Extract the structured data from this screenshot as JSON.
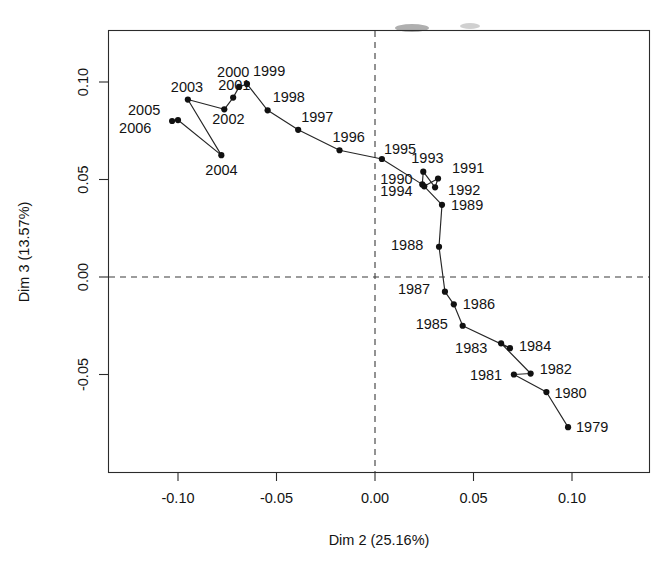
{
  "chart_data": {
    "type": "scatter",
    "title": "",
    "subtitle": "",
    "xlabel": "Dim 2 (25.16%)",
    "ylabel": "Dim 3 (13.57%)",
    "xlim": [
      -0.1245,
      0.1145
    ],
    "ylim": [
      -0.0955,
      0.1255
    ],
    "xticks": [
      "-0.10",
      "-0.05",
      "0.00",
      "0.05",
      "0.10"
    ],
    "xtick_values": [
      -0.1,
      -0.05,
      0.0,
      0.05,
      0.1
    ],
    "yticks": [
      "-0.05",
      "0.00",
      "0.05",
      "0.10"
    ],
    "ytick_values": [
      -0.05,
      0.0,
      0.05,
      0.1
    ],
    "grid": false,
    "legend": "none",
    "reference_lines": [
      {
        "orientation": "vertical",
        "value": 0.0,
        "style": "dashed"
      },
      {
        "orientation": "horizontal",
        "value": 0.0,
        "style": "dashed"
      }
    ],
    "connected": true,
    "connection_order": "1979 to 2006 chronological trajectory",
    "point_labels": [
      "1979",
      "1980",
      "1981",
      "1982",
      "1983",
      "1984",
      "1985",
      "1986",
      "1987",
      "1988",
      "1989",
      "1990",
      "1991",
      "1992",
      "1993",
      "1994",
      "1995",
      "1996",
      "1997",
      "1998",
      "1999",
      "2000",
      "2001",
      "2002",
      "2003",
      "2004",
      "2005",
      "2006"
    ],
    "x": [
      0.098,
      0.087,
      0.0705,
      0.079,
      0.064,
      0.0685,
      0.0445,
      0.04,
      0.0355,
      0.0325,
      0.034,
      0.025,
      0.032,
      0.0305,
      0.0245,
      0.024,
      0.0035,
      -0.018,
      -0.039,
      -0.0545,
      -0.065,
      -0.069,
      -0.072,
      -0.0765,
      -0.095,
      -0.078,
      -0.1,
      -0.103
    ],
    "y": [
      -0.077,
      -0.059,
      -0.05,
      -0.0495,
      -0.034,
      -0.0365,
      -0.025,
      -0.014,
      -0.0075,
      0.0155,
      0.037,
      0.0465,
      0.0505,
      0.046,
      0.054,
      0.0475,
      0.0605,
      0.065,
      0.0755,
      0.0855,
      0.099,
      0.0975,
      0.092,
      0.086,
      0.091,
      0.0625,
      0.0805,
      0.08
    ],
    "points": [
      {
        "label": "1979",
        "x": 0.098,
        "y": -0.077
      },
      {
        "label": "1980",
        "x": 0.087,
        "y": -0.059
      },
      {
        "label": "1981",
        "x": 0.0705,
        "y": -0.05
      },
      {
        "label": "1982",
        "x": 0.079,
        "y": -0.0495
      },
      {
        "label": "1983",
        "x": 0.064,
        "y": -0.034
      },
      {
        "label": "1984",
        "x": 0.0685,
        "y": -0.0365
      },
      {
        "label": "1985",
        "x": 0.0445,
        "y": -0.025
      },
      {
        "label": "1986",
        "x": 0.04,
        "y": -0.014
      },
      {
        "label": "1987",
        "x": 0.0355,
        "y": -0.0075
      },
      {
        "label": "1988",
        "x": 0.0325,
        "y": 0.0155
      },
      {
        "label": "1989",
        "x": 0.034,
        "y": 0.037
      },
      {
        "label": "1990",
        "x": 0.025,
        "y": 0.0465
      },
      {
        "label": "1991",
        "x": 0.032,
        "y": 0.0505
      },
      {
        "label": "1992",
        "x": 0.0305,
        "y": 0.046
      },
      {
        "label": "1993",
        "x": 0.0245,
        "y": 0.054
      },
      {
        "label": "1994",
        "x": 0.024,
        "y": 0.0475
      },
      {
        "label": "1995",
        "x": 0.0035,
        "y": 0.0605
      },
      {
        "label": "1996",
        "x": -0.018,
        "y": 0.065
      },
      {
        "label": "1997",
        "x": -0.039,
        "y": 0.0755
      },
      {
        "label": "1998",
        "x": -0.0545,
        "y": 0.0855
      },
      {
        "label": "1999",
        "x": -0.065,
        "y": 0.099
      },
      {
        "label": "2000",
        "x": -0.069,
        "y": 0.0975
      },
      {
        "label": "2001",
        "x": -0.072,
        "y": 0.092
      },
      {
        "label": "2002",
        "x": -0.0765,
        "y": 0.086
      },
      {
        "label": "2003",
        "x": -0.095,
        "y": 0.091
      },
      {
        "label": "2004",
        "x": -0.078,
        "y": 0.0625
      },
      {
        "label": "2005",
        "x": -0.1,
        "y": 0.0805
      },
      {
        "label": "2006",
        "x": -0.103,
        "y": 0.08
      }
    ],
    "label_offsets": [
      {
        "label": "1979",
        "dx": 8,
        "dy": 5
      },
      {
        "label": "1980",
        "dx": 8,
        "dy": 6
      },
      {
        "label": "1981",
        "dx": -44,
        "dy": 5
      },
      {
        "label": "1982",
        "dx": 9,
        "dy": 0
      },
      {
        "label": "1983",
        "dx": -46,
        "dy": 10
      },
      {
        "label": "1984",
        "dx": 9,
        "dy": 3
      },
      {
        "label": "1985",
        "dx": -47,
        "dy": 3
      },
      {
        "label": "1986",
        "dx": 9,
        "dy": 5
      },
      {
        "label": "1987",
        "dx": -47,
        "dy": 2
      },
      {
        "label": "1988",
        "dx": -48,
        "dy": 3
      },
      {
        "label": "1989",
        "dx": 9,
        "dy": 5
      },
      {
        "label": "1990",
        "dx": -44,
        "dy": -2
      },
      {
        "label": "1991",
        "dx": 14,
        "dy": -6
      },
      {
        "label": "1992",
        "dx": 13,
        "dy": 8
      },
      {
        "label": "1993",
        "dx": -12,
        "dy": -9
      },
      {
        "label": "1994",
        "dx": -42,
        "dy": 12
      },
      {
        "label": "1995",
        "dx": 2,
        "dy": -5
      },
      {
        "label": "1996",
        "dx": -7,
        "dy": -8
      },
      {
        "label": "1997",
        "dx": 3,
        "dy": -8
      },
      {
        "label": "1998",
        "dx": 5,
        "dy": -8
      },
      {
        "label": "1999",
        "dx": 6,
        "dy": -8
      },
      {
        "label": "2000",
        "dx": -22,
        "dy": -10
      },
      {
        "label": "2001",
        "dx": -15,
        "dy": -8
      },
      {
        "label": "2002",
        "dx": -12,
        "dy": 15
      },
      {
        "label": "2003",
        "dx": -17,
        "dy": -8
      },
      {
        "label": "2004",
        "dx": -16,
        "dy": 20
      },
      {
        "label": "2005",
        "dx": -50,
        "dy": -5
      },
      {
        "label": "2006",
        "dx": -53,
        "dy": 12
      }
    ]
  }
}
